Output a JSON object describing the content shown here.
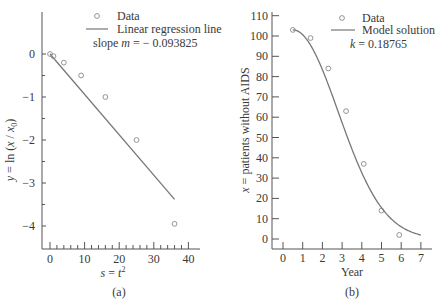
{
  "chart_data": [
    {
      "type": "scatter",
      "panel_label": "(a)",
      "xlabel": "s = t²",
      "ylabel": "y = ln (x / x₀)",
      "xlim": [
        -3,
        43
      ],
      "ylim": [
        -4.5,
        0.9
      ],
      "xticks": [
        0,
        10,
        20,
        30,
        40
      ],
      "yticks": [
        0,
        -1,
        -2,
        -3,
        -4
      ],
      "legend": [
        "Data",
        "Linear regression line"
      ],
      "annotation": "slope m = − 0.093825",
      "series": [
        {
          "name": "Data",
          "kind": "markers",
          "x": [
            0,
            1,
            4,
            9,
            16,
            25,
            36
          ],
          "y": [
            0,
            -0.05,
            -0.2,
            -0.5,
            -1.0,
            -2.0,
            -3.95
          ]
        },
        {
          "name": "Linear regression line",
          "kind": "line",
          "x": [
            0,
            36
          ],
          "y": [
            0,
            -3.38
          ],
          "slope": -0.093825
        }
      ],
      "grid": false,
      "legend_position": "upper right"
    },
    {
      "type": "scatter",
      "panel_label": "(b)",
      "xlabel": "Year",
      "ylabel": "x = patients without AIDS",
      "xlim": [
        -0.5,
        7.5
      ],
      "ylim": [
        -5,
        110
      ],
      "xticks": [
        0,
        1,
        2,
        3,
        4,
        5,
        6,
        7
      ],
      "yticks": [
        0,
        10,
        20,
        30,
        40,
        50,
        60,
        70,
        80,
        90,
        100,
        110
      ],
      "legend": [
        "Data",
        "Model solution"
      ],
      "annotation": "k = 0.18765",
      "series": [
        {
          "name": "Data",
          "kind": "markers",
          "x": [
            0.5,
            1.4,
            2.3,
            3.2,
            4.1,
            5.0,
            5.9
          ],
          "y": [
            103,
            99,
            84,
            63,
            37,
            14,
            2
          ]
        },
        {
          "name": "Model solution",
          "kind": "line",
          "x0": 0.5,
          "x_end": 7.0,
          "y0": 103,
          "k": 0.18765
        }
      ],
      "grid": false,
      "legend_position": "upper right"
    }
  ],
  "labels": {
    "a": {
      "legend_data": "Data",
      "legend_line": "Linear regression line",
      "slope_prefix": "slope ",
      "slope_var": "m",
      "slope_value": " = − 0.093825",
      "xlabel": "s = t",
      "xlabel_sup": "2",
      "ylabel": "y = ln (x / x",
      "ylabel_sub": "0",
      "ylabel_close": ")",
      "panel": "(a)",
      "xticks": [
        "0",
        "10",
        "20",
        "30",
        "40"
      ],
      "yticks": [
        "0",
        "−1",
        "−2",
        "−3",
        "−4"
      ]
    },
    "b": {
      "legend_data": "Data",
      "legend_line": "Model solution",
      "k_var": "k",
      "k_value": " = 0.18765",
      "xlabel": "Year",
      "ylabel": "x = patients without AIDS",
      "panel": "(b)",
      "xticks": [
        "0",
        "1",
        "2",
        "3",
        "4",
        "5",
        "6",
        "7"
      ],
      "yticks": [
        "0",
        "10",
        "20",
        "30",
        "40",
        "50",
        "60",
        "70",
        "80",
        "90",
        "100",
        "110"
      ]
    }
  },
  "colors": {
    "axis": "#555555",
    "line": "#777777",
    "marker": "#888888",
    "text": "#3a3a3a"
  }
}
